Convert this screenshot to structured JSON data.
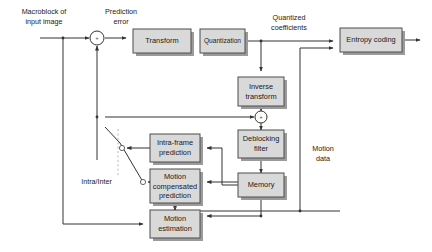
{
  "diagram": {
    "colors": {
      "block_fill": "#d9d9d9",
      "block_stroke": "#4d4d4d",
      "block_shadow": "#9b9b9b",
      "wire": "#333333",
      "switch_dash": "#b3b3b3",
      "background": "#ffffff",
      "text": "#1a1a1a"
    },
    "blocks": [
      {
        "id": "transform",
        "label": "Transform",
        "x": 133,
        "y": 29,
        "w": 58,
        "h": 24
      },
      {
        "id": "quantization",
        "label": "Quantization",
        "x": 200,
        "y": 29,
        "w": 45,
        "h": 24
      },
      {
        "id": "entropy_coding",
        "label": "Entropy coding",
        "x": 340,
        "y": 28,
        "w": 62,
        "h": 24
      },
      {
        "id": "inverse_transform",
        "label": "Inverse\ntransform",
        "x": 238,
        "y": 77,
        "w": 46,
        "h": 29
      },
      {
        "id": "deblocking_filter",
        "label": "Deblocking\nfilter",
        "x": 238,
        "y": 130,
        "w": 46,
        "h": 28
      },
      {
        "id": "memory",
        "label": "Memory",
        "x": 238,
        "y": 173,
        "w": 46,
        "h": 24
      },
      {
        "id": "intra_frame_prediction",
        "label": "Intra-frame\nprediction",
        "x": 150,
        "y": 134,
        "w": 50,
        "h": 28
      },
      {
        "id": "motion_compensated_prediction",
        "label": "Motion\ncompensated\nprediction",
        "x": 150,
        "y": 169,
        "w": 50,
        "h": 34
      },
      {
        "id": "motion_estimation",
        "label": "Motion\nestimation",
        "x": 150,
        "y": 210,
        "w": 50,
        "h": 28
      }
    ],
    "annotations": [
      {
        "id": "macroblock_of_input_image",
        "label": "Macroblock of\ninput image",
        "x": 44,
        "y": 17
      },
      {
        "id": "prediction_error",
        "label": "Prediction\nerror",
        "x": 120,
        "y": 17
      },
      {
        "id": "quantized_coefficients",
        "label": "Quantized\ncoefficients",
        "x": 288,
        "y": 22
      },
      {
        "id": "motion_data",
        "label": "Motion\ndata",
        "x": 322,
        "y": 153
      },
      {
        "id": "intra_inter",
        "label": "Intra/Inter",
        "x": 112,
        "y": 182
      }
    ],
    "adders": [
      {
        "id": "adder-prediction-error",
        "cx": 97,
        "cy": 38,
        "r": 7,
        "sign": "+"
      },
      {
        "id": "adder-reconstruction",
        "cx": 261,
        "cy": 117,
        "r": 6,
        "sign": "+"
      }
    ],
    "switch": {
      "id": "intra-inter-switch",
      "label": "Intra/Inter",
      "node_intra": {
        "cx": 122,
        "cy": 148,
        "r": 2.6
      },
      "node_inter": {
        "cx": 143,
        "cy": 182,
        "r": 2.6
      },
      "lever_from": {
        "x": 105,
        "y": 127
      },
      "lever_to": {
        "x": 143,
        "y": 182
      },
      "pivot_dash": {
        "x": 118,
        "y1": 129,
        "y2": 176
      }
    }
  }
}
